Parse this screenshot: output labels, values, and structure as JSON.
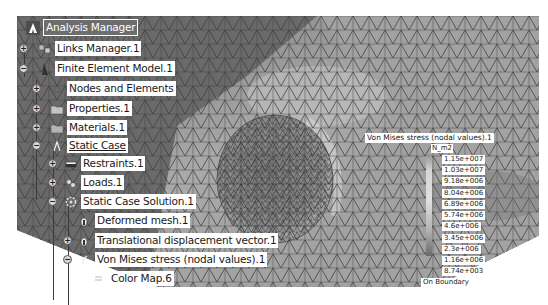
{
  "tree": {
    "root": "Analysis Manager",
    "items": [
      {
        "label": "Links Manager.1",
        "expander": "+",
        "icon": "links-manager-icon"
      },
      {
        "label": "Finite Element Model.1",
        "expander": "-",
        "icon": "finite-element-model-icon"
      },
      {
        "label": "Nodes and Elements",
        "expander": "+",
        "icon": "nodes-elements-icon"
      },
      {
        "label": "Properties.1",
        "expander": "+",
        "icon": "properties-folder-icon"
      },
      {
        "label": "Materials.1",
        "expander": "+",
        "icon": "materials-folder-icon"
      },
      {
        "label": "Static Case",
        "expander": "-",
        "icon": "static-case-icon"
      },
      {
        "label": "Restraints.1",
        "expander": "+",
        "icon": "restraints-icon"
      },
      {
        "label": "Loads.1",
        "expander": "+",
        "icon": "loads-icon"
      },
      {
        "label": "Static Case Solution.1",
        "expander": "-",
        "icon": "solution-gear-icon"
      },
      {
        "label": "Deformed mesh.1",
        "expander": "",
        "icon": "deformed-mesh-icon"
      },
      {
        "label": "Translational displacement vector.1",
        "expander": "+",
        "icon": "displacement-vector-icon"
      },
      {
        "label": "Von Mises stress (nodal values).1",
        "expander": "-",
        "icon": "von-mises-icon"
      },
      {
        "label": "Color Map.6",
        "expander": "",
        "icon": "color-map-icon"
      }
    ]
  },
  "legend": {
    "title": "Von Mises stress (nodal values).1",
    "unit": "N_m2",
    "ticks": [
      "1.15e+007",
      "1.03e+007",
      "9.18e+006",
      "8.04e+006",
      "6.89e+006",
      "5.74e+006",
      "4.6e+006",
      "3.45e+006",
      "2.3e+006",
      "1.16e+006",
      "8.74e+003"
    ],
    "footer": "On Boundary"
  },
  "colors": {
    "viewport_bg": "#8a8a8a",
    "label_bg": "#ffffff",
    "root_bg": "#6d6d6d"
  }
}
